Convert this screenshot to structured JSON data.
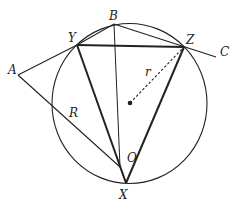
{
  "diagram": {
    "type": "geometry",
    "colors": {
      "stroke": "#222222",
      "background": "#ffffff"
    },
    "circle": {
      "cx": 129.5,
      "cy": 103.5,
      "rx": 77.5,
      "ry": 80
    },
    "center_dot": {
      "x": 130,
      "y": 103
    },
    "points": {
      "A": {
        "label": "A",
        "x": 18,
        "y": 75,
        "lx": 8,
        "ly": 74
      },
      "B": {
        "label": "B",
        "x": 114,
        "y": 24,
        "lx": 109,
        "ly": 20
      },
      "C": {
        "label": "C",
        "x": 216,
        "y": 57,
        "lx": 220,
        "ly": 56
      },
      "O": {
        "label": "O",
        "x": 120,
        "y": 167,
        "lx": 127,
        "ly": 162
      },
      "X": {
        "label": "X",
        "x": 126,
        "y": 183,
        "lx": 119,
        "ly": 199
      },
      "Y": {
        "label": "Y",
        "x": 77,
        "y": 45,
        "lx": 68,
        "ly": 42
      },
      "Z": {
        "label": "Z",
        "x": 184,
        "y": 47,
        "lx": 186,
        "ly": 44
      }
    },
    "segment_labels": {
      "r": {
        "label": "r",
        "x": 145,
        "y": 76
      },
      "R": {
        "label": "R",
        "x": 69,
        "y": 117
      }
    }
  }
}
